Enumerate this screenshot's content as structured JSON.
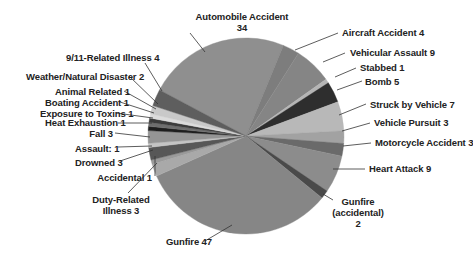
{
  "chart_data": {
    "type": "pie",
    "title": "",
    "total": 146,
    "center": [
      246,
      136
    ],
    "radius": 98,
    "start_angle_deg": -62,
    "slices": [
      {
        "label": "Automobile Accident",
        "value": 34,
        "color": "#8f8f8f"
      },
      {
        "label": "Aircraft Accident",
        "value": 4,
        "color": "#7d7d7d"
      },
      {
        "label": "Vehicular Assault",
        "value": 9,
        "color": "#858585"
      },
      {
        "label": "Stabbed",
        "value": 1,
        "color": "#b5b5b5"
      },
      {
        "label": "Bomb",
        "value": 5,
        "color": "#2e2e2e"
      },
      {
        "label": "Struck by Vehicle",
        "value": 7,
        "color": "#b8b8b8"
      },
      {
        "label": "Vehicle Pursuit",
        "value": 3,
        "color": "#a2a2a2"
      },
      {
        "label": "Motorcycle Accident",
        "value": 3,
        "color": "#6a6a6a"
      },
      {
        "label": "Heart Attack",
        "value": 9,
        "color": "#8c8c8c"
      },
      {
        "label": "Gunfire (accidental)",
        "value": 2,
        "color": "#4a4a4a"
      },
      {
        "label": "Gunfire",
        "value": 47,
        "color": "#868686"
      },
      {
        "label": "Duty-Related Illness",
        "value": 3,
        "color": "#a9a9a9"
      },
      {
        "label": "Accidental",
        "value": 1,
        "color": "#9a9a9a"
      },
      {
        "label": "Drowned",
        "value": 3,
        "color": "#575757"
      },
      {
        "label": "Assault",
        "value": 1,
        "color": "#c4c4c4"
      },
      {
        "label": "Fall",
        "value": 3,
        "color": "#959595"
      },
      {
        "label": "Heat Exhaustion",
        "value": 1,
        "color": "#1e1e1e"
      },
      {
        "label": "Exposure to Toxins",
        "value": 1,
        "color": "#6e6e6e"
      },
      {
        "label": "Boating Accident",
        "value": 1,
        "color": "#3c3c3c"
      },
      {
        "label": "Animal Related",
        "value": 1,
        "color": "#dcdcdc"
      },
      {
        "label": "Weather/Natural Disaster",
        "value": 2,
        "color": "#c9c9c9"
      },
      {
        "label": "9/11-Related Illness",
        "value": 4,
        "color": "#5e5e5e"
      }
    ],
    "labels": [
      {
        "text": [
          "Automobile Accident",
          "34"
        ],
        "x": 187,
        "y": 11,
        "align": "c",
        "w": 110,
        "line": [
          [
            190,
            33
          ],
          [
            205,
            52
          ]
        ]
      },
      {
        "text": [
          "Aircraft Accident 4"
        ],
        "x": 342,
        "y": 27,
        "align": "l",
        "line": [
          [
            338,
            33
          ],
          [
            295,
            50
          ]
        ]
      },
      {
        "text": [
          "Vehicular Assault 9"
        ],
        "x": 350,
        "y": 47,
        "align": "l",
        "line": [
          [
            345,
            53
          ],
          [
            323,
            62
          ]
        ]
      },
      {
        "text": [
          "Stabbed 1"
        ],
        "x": 360,
        "y": 62,
        "align": "l",
        "line": [
          [
            356,
            68
          ],
          [
            335,
            77
          ]
        ]
      },
      {
        "text": [
          "Bomb 5"
        ],
        "x": 365,
        "y": 76,
        "align": "l",
        "line": [
          [
            362,
            81
          ],
          [
            337,
            90
          ]
        ]
      },
      {
        "text": [
          "Struck by Vehicle 7"
        ],
        "x": 370,
        "y": 99,
        "align": "l",
        "line": [
          [
            366,
            104
          ],
          [
            339,
            115
          ]
        ]
      },
      {
        "text": [
          "Vehicle Pursuit 3"
        ],
        "x": 374,
        "y": 117,
        "align": "l",
        "line": [
          [
            370,
            123
          ],
          [
            342,
            131
          ]
        ]
      },
      {
        "text": [
          "Motorcycle Accident 3"
        ],
        "x": 375,
        "y": 137,
        "align": "l",
        "line": [
          [
            371,
            143
          ],
          [
            343,
            146
          ]
        ]
      },
      {
        "text": [
          "Heart Attack 9"
        ],
        "x": 369,
        "y": 163,
        "align": "l",
        "line": [
          [
            365,
            169
          ],
          [
            333,
            169
          ]
        ]
      },
      {
        "text": [
          "Gunfire",
          "(accidental)",
          "2"
        ],
        "x": 325,
        "y": 196,
        "align": "c",
        "w": 66,
        "line": [
          [
            333,
            200
          ],
          [
            323,
            194
          ]
        ]
      },
      {
        "text": [
          "Gunfire 47"
        ],
        "x": 166,
        "y": 236,
        "align": "l",
        "line": [
          [
            205,
            241
          ],
          [
            232,
            225
          ]
        ]
      },
      {
        "text": [
          "Duty-Related",
          "Illness 3"
        ],
        "x": 75,
        "y": 194,
        "align": "c",
        "w": 92,
        "line": [
          [
            128,
            193
          ],
          [
            157,
            163
          ]
        ]
      },
      {
        "text": [
          "Accidental 1"
        ],
        "x": 75,
        "y": 172,
        "align": "r",
        "w": 77,
        "line": [
          [
            155,
            176
          ],
          [
            155,
            156
          ]
        ]
      },
      {
        "text": [
          "Drowned 3"
        ],
        "x": 75,
        "y": 157,
        "align": "r",
        "w": 44,
        "line": [
          [
            120,
            161
          ],
          [
            153,
            150
          ]
        ]
      },
      {
        "text": [
          "Assault: 1"
        ],
        "x": 75,
        "y": 143,
        "align": "r",
        "w": 40,
        "line": [
          [
            118,
            147
          ],
          [
            152,
            146
          ]
        ]
      },
      {
        "text": [
          "Fall 3"
        ],
        "x": 75,
        "y": 128,
        "align": "r",
        "w": 38,
        "line": [
          [
            115,
            133
          ],
          [
            150,
            137
          ]
        ]
      },
      {
        "text": [
          "Heat Exhaustion 1"
        ],
        "x": 45,
        "y": 117,
        "align": "r",
        "w": 72,
        "line": [
          [
            118,
            123
          ],
          [
            152,
            123
          ]
        ]
      },
      {
        "text": [
          "Exposure to Toxins 1"
        ],
        "x": 40,
        "y": 108,
        "align": "r",
        "w": 73,
        "line": [
          [
            116,
            113
          ],
          [
            153,
            118
          ]
        ]
      },
      {
        "text": [
          "Boating Accident 1"
        ],
        "x": 45,
        "y": 97,
        "align": "r",
        "w": 72,
        "line": [
          [
            120,
            102
          ],
          [
            154,
            113
          ]
        ]
      },
      {
        "text": [
          "Animal Related 1"
        ],
        "x": 55,
        "y": 86,
        "align": "r",
        "w": 67,
        "line": [
          [
            124,
            91
          ],
          [
            156,
            109
          ]
        ]
      },
      {
        "text": [
          "Weather/Natural Disaster 2"
        ],
        "x": 26,
        "y": 71,
        "align": "r",
        "w": 102,
        "line": [
          [
            129,
            76
          ],
          [
            158,
            104
          ]
        ]
      },
      {
        "text": [
          "9/11-Related Illness 4"
        ],
        "x": 66,
        "y": 52,
        "align": "r",
        "w": 82,
        "line": [
          [
            145,
            63
          ],
          [
            162,
            91
          ]
        ]
      }
    ]
  }
}
